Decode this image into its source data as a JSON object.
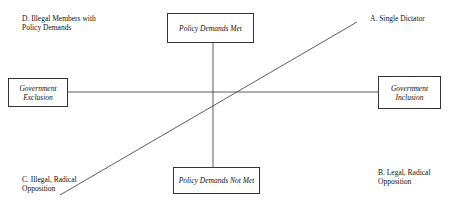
{
  "diagram": {
    "boxes": {
      "top": "Policy Demands Met",
      "bottom": "Policy Demands Not Met",
      "left_line1": "Government",
      "left_line2": "Exclusion",
      "right_line1": "Government",
      "right_line2": "Inclusion"
    },
    "quadrants": {
      "a": {
        "line1": "A.  Single Dictator"
      },
      "b": {
        "line1": "B.  Legal, Radical",
        "line2": "Opposition"
      },
      "c": {
        "line1": "C.  Illegal, Radical",
        "line2": "Opposition"
      },
      "d": {
        "line1": "D.  Illegal Members with",
        "line2": "Policy Demands"
      }
    },
    "colors": {
      "line": "#333333",
      "border": "#333333",
      "text": "#111111"
    }
  }
}
